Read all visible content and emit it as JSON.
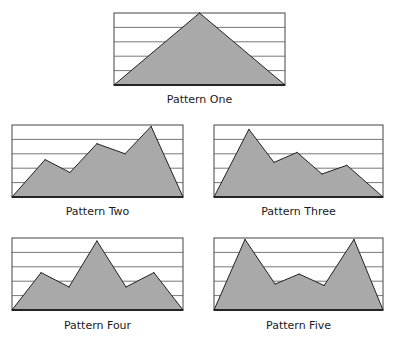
{
  "colors": {
    "fill": "#a9a9a9",
    "stroke": "#222222",
    "grid": "#555555",
    "frame": "#444444"
  },
  "chart_data": [
    {
      "type": "area",
      "title": "Pattern One",
      "x": [
        0,
        3,
        6
      ],
      "values": [
        0,
        5,
        0
      ],
      "xlim": [
        0,
        6
      ],
      "ylim": [
        0,
        5
      ],
      "grid": true,
      "gridlines": 4
    },
    {
      "type": "area",
      "title": "Pattern Two",
      "x": [
        0,
        1.16,
        2.03,
        2.98,
        3.97,
        4.88,
        6
      ],
      "values": [
        0,
        2.6,
        1.7,
        3.7,
        3.0,
        4.9,
        0
      ],
      "xlim": [
        0,
        6
      ],
      "ylim": [
        0,
        5
      ],
      "grid": true,
      "gridlines": 4
    },
    {
      "type": "area",
      "title": "Pattern Three",
      "x": [
        0,
        1.24,
        2.13,
        2.95,
        3.83,
        4.72,
        6
      ],
      "values": [
        0,
        4.7,
        2.4,
        3.1,
        1.6,
        2.2,
        0
      ],
      "xlim": [
        0,
        6
      ],
      "ylim": [
        0,
        5
      ],
      "grid": true,
      "gridlines": 4
    },
    {
      "type": "area",
      "title": "Pattern Four",
      "x": [
        0,
        1.02,
        2.0,
        2.98,
        4.0,
        4.98,
        6
      ],
      "values": [
        0,
        2.6,
        1.6,
        4.8,
        1.6,
        2.6,
        0
      ],
      "xlim": [
        0,
        6
      ],
      "ylim": [
        0,
        5
      ],
      "grid": true,
      "gridlines": 4
    },
    {
      "type": "area",
      "title": "Pattern Five",
      "x": [
        0,
        1.1,
        2.17,
        3.02,
        3.91,
        4.97,
        6
      ],
      "values": [
        0,
        4.9,
        1.8,
        2.5,
        1.7,
        4.9,
        0
      ],
      "xlim": [
        0,
        6
      ],
      "ylim": [
        0,
        5
      ],
      "grid": true,
      "gridlines": 4
    }
  ]
}
